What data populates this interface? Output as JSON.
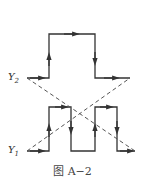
{
  "labels": {
    "y2": "Y",
    "y2_sub": "2",
    "y1": "Y",
    "y1_sub": "1"
  },
  "caption": "图 A−2",
  "colors": {
    "stroke": "#333333",
    "dash": "#555555"
  }
}
